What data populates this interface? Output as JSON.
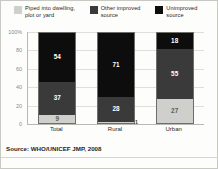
{
  "legend": {
    "items": [
      {
        "label": "Piped into dwelling, plot or yard",
        "color": "#cfcfcb",
        "key": "piped"
      },
      {
        "label": "Other improved source",
        "color": "#3a3a3a",
        "key": "other_improved"
      },
      {
        "label": "Unimproved source",
        "color": "#0d0d0d",
        "key": "unimproved"
      }
    ]
  },
  "axis": {
    "y_ticks": [
      "100%",
      "80",
      "60",
      "40",
      "20",
      "0"
    ],
    "x_ticks": [
      "Total",
      "Rural",
      "Urban"
    ]
  },
  "source": {
    "label": "Source:",
    "text": "WHO/UNICEF JMP, 2008"
  },
  "chart_data": {
    "type": "bar",
    "subtype": "stacked-100-percent",
    "title": "",
    "subtitle": "",
    "xlabel": "",
    "ylabel": "",
    "ylim": [
      0,
      100
    ],
    "y_tick_values": [
      0,
      20,
      40,
      60,
      80,
      100
    ],
    "grid": true,
    "legend_position": "top",
    "categories": [
      "Total",
      "Rural",
      "Urban"
    ],
    "series": [
      {
        "name": "Piped into dwelling, plot or yard",
        "color": "#cfcfcb",
        "values": [
          9,
          1,
          27
        ],
        "labels": [
          "9",
          "1",
          "27"
        ]
      },
      {
        "name": "Other improved source",
        "color": "#3a3a3a",
        "values": [
          37,
          28,
          55
        ],
        "labels": [
          "37",
          "28",
          "55"
        ]
      },
      {
        "name": "Unimproved source",
        "color": "#0d0d0d",
        "values": [
          54,
          71,
          18
        ],
        "labels": [
          "54",
          "71",
          "18"
        ]
      }
    ],
    "annotations": [
      "Source: WHO/UNICEF JMP, 2008"
    ]
  }
}
